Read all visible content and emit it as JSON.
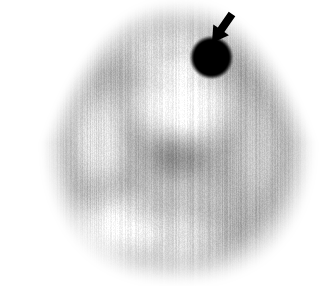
{
  "image": {
    "modality": "nuclear-medicine-tomographic-slice",
    "orientation": "transverse",
    "colormap": "grayscale-inverted",
    "width": 326,
    "height": 286,
    "background_color": "#ffffff",
    "caption": ""
  },
  "body_outline": {
    "shape": "rounded-triangular-cross-section",
    "center": {
      "x": 178,
      "y": 142
    },
    "radius_x": 122,
    "radius_y": 126,
    "edge_softness_px": 26,
    "fill_gray_hex": "#c9c9c9"
  },
  "uptake_regions": [
    {
      "name": "anterior-midline-photopenic-zone",
      "x": 184,
      "y": 106,
      "rx": 44,
      "ry": 34,
      "intensity": 0.02,
      "softness": 30
    },
    {
      "name": "left-anterior-cortical-band",
      "x": 128,
      "y": 96,
      "rx": 30,
      "ry": 24,
      "intensity": 0.3,
      "softness": 26
    },
    {
      "name": "right-anterior-cortical-band",
      "x": 240,
      "y": 112,
      "rx": 30,
      "ry": 26,
      "intensity": 0.34,
      "softness": 26
    },
    {
      "name": "central-midline-focus",
      "x": 176,
      "y": 152,
      "rx": 22,
      "ry": 18,
      "intensity": 0.46,
      "softness": 20
    },
    {
      "name": "left-mid-cortical-patch",
      "x": 132,
      "y": 168,
      "rx": 26,
      "ry": 22,
      "intensity": 0.3,
      "softness": 24
    },
    {
      "name": "right-mid-cortical-patch",
      "x": 226,
      "y": 168,
      "rx": 26,
      "ry": 22,
      "intensity": 0.32,
      "softness": 24
    },
    {
      "name": "left-posterior-patch",
      "x": 142,
      "y": 208,
      "rx": 28,
      "ry": 22,
      "intensity": 0.3,
      "softness": 26
    },
    {
      "name": "right-posterior-patch",
      "x": 218,
      "y": 206,
      "rx": 28,
      "ry": 22,
      "intensity": 0.3,
      "softness": 26
    },
    {
      "name": "posterior-midline-band",
      "x": 180,
      "y": 196,
      "rx": 34,
      "ry": 20,
      "intensity": 0.26,
      "softness": 26
    },
    {
      "name": "inferior-midline-fade",
      "x": 176,
      "y": 238,
      "rx": 40,
      "ry": 22,
      "intensity": 0.14,
      "softness": 28
    },
    {
      "name": "left-lateral-rim",
      "x": 98,
      "y": 140,
      "rx": 24,
      "ry": 40,
      "intensity": 0.12,
      "softness": 28
    },
    {
      "name": "right-lateral-rim",
      "x": 258,
      "y": 150,
      "rx": 22,
      "ry": 44,
      "intensity": 0.24,
      "softness": 28
    },
    {
      "name": "superior-midline-cap",
      "x": 172,
      "y": 52,
      "rx": 44,
      "ry": 24,
      "intensity": 0.14,
      "softness": 28
    },
    {
      "name": "left-inferior-photopenic",
      "x": 112,
      "y": 226,
      "rx": 30,
      "ry": 26,
      "intensity": 0.04,
      "softness": 28
    }
  ],
  "lesion": {
    "label": "focal-hot-spot",
    "center": {
      "x": 211,
      "y": 57
    },
    "radius": 20,
    "fill_hex": "#000000",
    "edge_softness_px": 3
  },
  "arrow": {
    "label": "lesion-pointer-arrow",
    "color_hex": "#000000",
    "tail": {
      "x": 232,
      "y": 14
    },
    "tip": {
      "x": 212,
      "y": 43
    },
    "direction": "down-left",
    "shaft_width": 8,
    "head_width": 19,
    "head_length": 16
  },
  "noise": {
    "vertical_streak_amplitude": 0.05,
    "speckle_amplitude": 0.035,
    "seed": 20240917
  }
}
